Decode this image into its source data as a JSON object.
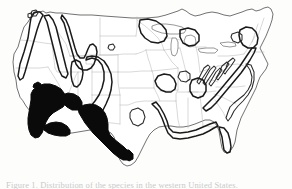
{
  "figure": {
    "kind": "distribution-map",
    "region": "United States (lower 48)",
    "title": "",
    "caption_partial": "Figure 1.  Distribution of the species in the western United States.",
    "background_color": "#fdfdfc"
  },
  "legend": {
    "present": false,
    "entries": [
      {
        "key": "filled",
        "label": "Core range (solid black fill)",
        "color": "#0a0a0a"
      },
      {
        "key": "outlined",
        "label": "Peripheral / secondary range (heavy outline)",
        "color": "#1a1a1a"
      },
      {
        "key": "state",
        "label": "State boundary",
        "color": "#b9b9b9"
      }
    ]
  },
  "map_data": {
    "type": "choropleth-outline",
    "filled_regions": [
      {
        "name": "california-central-valley-sierra",
        "fill": "#0a0a0a"
      },
      {
        "name": "southern-california-mojave",
        "fill": "#0a0a0a"
      },
      {
        "name": "arizona-new-mexico-basin",
        "fill": "#0a0a0a"
      },
      {
        "name": "west-texas-trans-pecos",
        "fill": "#0a0a0a"
      }
    ],
    "outlined_regions": [
      {
        "name": "cascade-range",
        "stroke": "#1a1a1a"
      },
      {
        "name": "northern-rockies-idaho",
        "stroke": "#1a1a1a"
      },
      {
        "name": "wasatch-great-basin",
        "stroke": "#1a1a1a"
      },
      {
        "name": "colorado-plateau-rockies",
        "stroke": "#1a1a1a"
      },
      {
        "name": "ozark-ouachita",
        "stroke": "#1a1a1a"
      },
      {
        "name": "appalachian-ridge-valley",
        "stroke": "#1a1a1a"
      },
      {
        "name": "great-lakes-uplands",
        "stroke": "#1a1a1a"
      },
      {
        "name": "new-england-uplands",
        "stroke": "#1a1a1a"
      },
      {
        "name": "gulf-coastal-plain",
        "stroke": "#1a1a1a"
      },
      {
        "name": "atlantic-coastal-plain",
        "stroke": "#1a1a1a"
      }
    ],
    "state_borders_visible": true,
    "lakes_visible": true,
    "colors": {
      "fill_black": "#0a0a0a",
      "range_stroke": "#1a1a1a",
      "coast_stroke": "#585858",
      "state_stroke": "#b9b9b9",
      "background": "#fdfdfc",
      "caption": "#c9c9c9"
    }
  }
}
